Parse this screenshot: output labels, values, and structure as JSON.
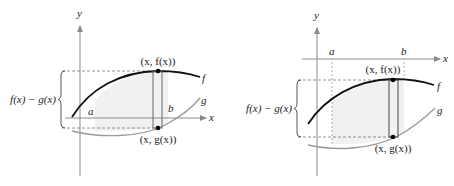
{
  "panels": [
    {
      "id": "left",
      "axis_labels": {
        "x": "x",
        "y": "y"
      },
      "bound_labels": {
        "a": "a",
        "b": "b"
      },
      "curve_labels": {
        "f": "f",
        "g": "g"
      },
      "point_labels": {
        "top": "(x, f(x))",
        "bottom": "(x, g(x))"
      },
      "height_label": "f(x) − g(x)",
      "note": "x-axis lies between f and g"
    },
    {
      "id": "right",
      "axis_labels": {
        "x": "x",
        "y": "y"
      },
      "bound_labels": {
        "a": "a",
        "b": "b"
      },
      "curve_labels": {
        "f": "f",
        "g": "g"
      },
      "point_labels": {
        "top": "(x, f(x))",
        "bottom": "(x, g(x))"
      },
      "height_label": "f(x) − g(x)",
      "note": "both curves below x-axis"
    }
  ],
  "colors": {
    "f_curve": "#111111",
    "g_curve": "#9a9a9a",
    "axis": "#8a8a8a",
    "shade": "#f1f1f1",
    "dashed": "#777777"
  }
}
